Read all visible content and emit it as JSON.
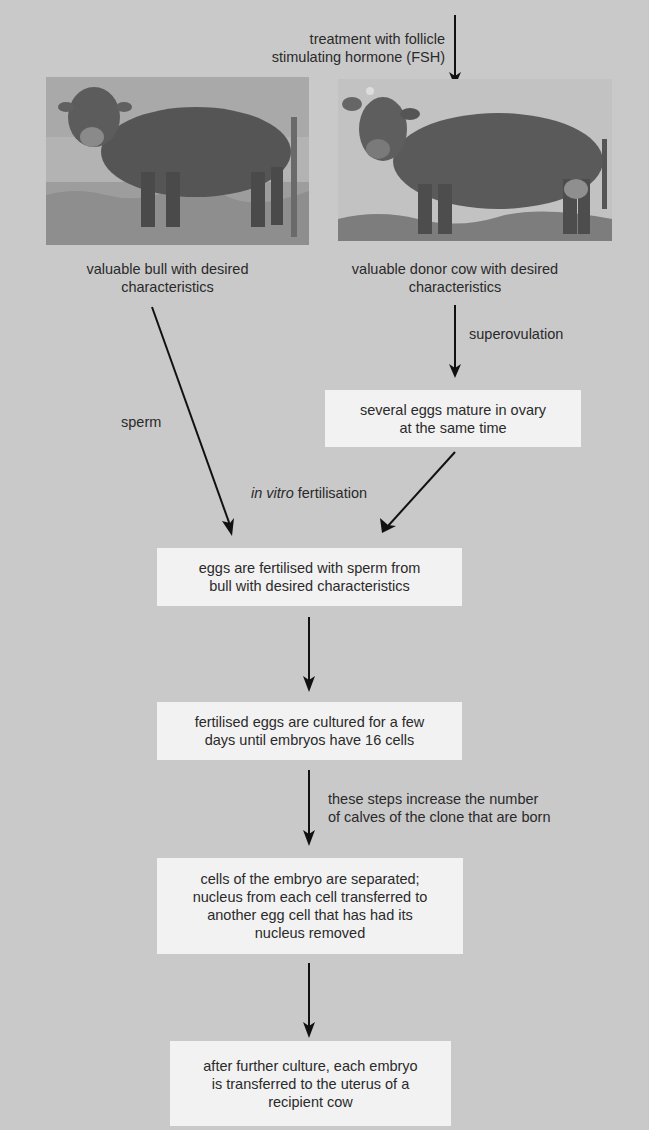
{
  "diagram": {
    "title": "",
    "fsh_label": "treatment with follicle stimulating hormone (FSH)",
    "fsh_label_lines": [
      "treatment with follicle",
      "stimulating hormone (FSH)"
    ],
    "bull": {
      "image_alt": "photo of bull",
      "caption_lines": [
        "valuable bull with desired",
        "characteristics"
      ]
    },
    "cow": {
      "image_alt": "photo of donor cow",
      "caption_lines": [
        "valuable donor cow with desired",
        "characteristics"
      ]
    },
    "sperm_label": "sperm",
    "superovulation_label": "superovulation",
    "ivf_label": {
      "italic": "in vitro",
      "rest": " fertilisation"
    },
    "side_note_lines": [
      "these steps increase the number",
      "of calves of the clone that are born"
    ],
    "boxes": [
      {
        "id": "eggs-mature",
        "lines": [
          "several eggs mature in ovary",
          "at the same time"
        ]
      },
      {
        "id": "eggs-fertilised",
        "lines": [
          "eggs are fertilised with sperm from",
          "bull with desired characteristics"
        ]
      },
      {
        "id": "eggs-cultured",
        "lines": [
          "fertilised eggs are cultured for a few",
          "days until embryos have 16 cells"
        ]
      },
      {
        "id": "cells-separated",
        "lines": [
          "cells of the embryo are separated;",
          "nucleus from each cell transferred to",
          "another egg cell that has had its",
          "nucleus removed"
        ]
      },
      {
        "id": "embryo-transferred",
        "lines": [
          "after further culture, each embryo",
          "is transferred to the uterus of a",
          "recipient cow"
        ]
      }
    ],
    "colors": {
      "background": "#c9c9c9",
      "box": "#f2f2f2",
      "text": "#2a2a2a",
      "arrow": "#111111"
    }
  }
}
